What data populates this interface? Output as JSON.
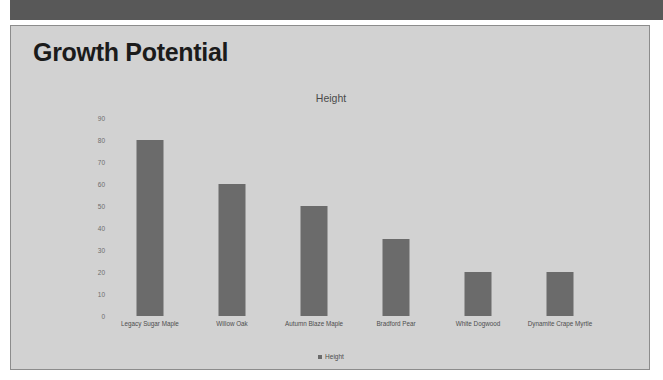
{
  "window": {
    "top_band_color": "#585858",
    "slide_background": "#d2d2d2",
    "slide_border_color": "#8c8c8c"
  },
  "slide": {
    "title": "Growth Potential"
  },
  "chart_data": {
    "type": "bar",
    "title": "Height",
    "xlabel": "",
    "ylabel": "",
    "ylim": [
      0,
      90
    ],
    "ytick_labels": [
      "90",
      "80",
      "70",
      "60",
      "50",
      "40",
      "30",
      "20",
      "10",
      "0"
    ],
    "yticks": [
      90,
      80,
      70,
      60,
      50,
      40,
      30,
      20,
      10,
      0
    ],
    "grid": false,
    "legend_position": "bottom",
    "legend": [
      "Height"
    ],
    "bar_color": "#6b6b6b",
    "categories": [
      "Legacy Sugar Maple",
      "Willow Oak",
      "Autumn Blaze Maple",
      "Bradford Pear",
      "White Dogwood",
      "Dynamite Crape Myrtle"
    ],
    "series": [
      {
        "name": "Height",
        "values": [
          80,
          60,
          50,
          35,
          20,
          20
        ]
      }
    ]
  }
}
